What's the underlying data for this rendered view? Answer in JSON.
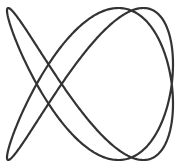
{
  "figure": {
    "type": "lissajous-curve",
    "freq_x": 2,
    "freq_y": 3,
    "phase": 0.5236,
    "center_x": 90,
    "center_y": 84,
    "amp_x": 83,
    "amp_y": 76,
    "stroke_color": "#333333",
    "stroke_width": 2.2,
    "background": "#ffffff"
  }
}
